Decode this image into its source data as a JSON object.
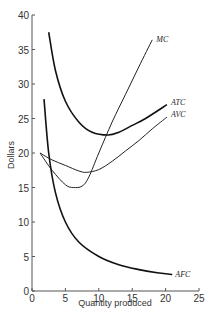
{
  "chart_data": {
    "type": "line",
    "title": "",
    "xlabel": "Quantity produced",
    "ylabel": "Dollars",
    "xlim": [
      0,
      25
    ],
    "ylim": [
      0,
      40
    ],
    "xticks": [
      0,
      5,
      10,
      15,
      20,
      25
    ],
    "yticks": [
      0,
      5,
      10,
      15,
      20,
      25,
      30,
      35,
      40
    ],
    "grid": false,
    "legend": "inline labels at curve ends",
    "series": [
      {
        "name": "MC",
        "x": [
          1.2,
          3,
          5,
          6.2,
          7.5,
          8.5,
          10,
          12,
          14,
          16,
          18
        ],
        "y": [
          20,
          17.5,
          15.4,
          15.0,
          15.2,
          16.5,
          20,
          24.5,
          28.5,
          32.5,
          36.4
        ]
      },
      {
        "name": "ATC",
        "x": [
          2.5,
          3.5,
          5,
          7,
          9,
          11.4,
          13,
          15,
          17,
          20.2
        ],
        "y": [
          37.5,
          32,
          27.5,
          24.5,
          23.0,
          22.6,
          23.0,
          24.0,
          25.0,
          27.0
        ]
      },
      {
        "name": "AVC",
        "x": [
          1.2,
          3,
          5,
          7,
          8.2,
          10,
          12,
          14,
          16,
          18,
          20.2
        ],
        "y": [
          20,
          19,
          18.2,
          17.4,
          17.2,
          17.6,
          18.8,
          20.3,
          21.8,
          23.5,
          25.2
        ]
      },
      {
        "name": "AFC",
        "x": [
          1.8,
          2.5,
          3.5,
          5,
          7,
          10,
          13,
          16,
          19,
          21
        ],
        "y": [
          27.8,
          20,
          14.3,
          10,
          7.1,
          5,
          3.8,
          3.1,
          2.6,
          2.4
        ]
      }
    ],
    "labels": {
      "mc": "MC",
      "atc": "ATC",
      "avc": "AVC",
      "afc": "AFC"
    }
  }
}
